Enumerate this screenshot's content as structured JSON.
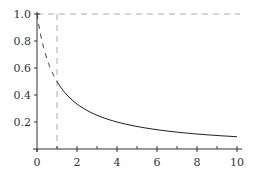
{
  "chart_data": {
    "type": "line",
    "title": "",
    "xlabel": "",
    "ylabel": "",
    "xlim": [
      0,
      10
    ],
    "ylim": [
      0,
      1.0
    ],
    "grid": false,
    "x_ticks": [
      "0",
      "2",
      "4",
      "6",
      "8",
      "10"
    ],
    "x_minor_ticks": [
      1,
      3,
      5,
      7,
      9
    ],
    "y_ticks": [
      "0.2",
      "0.4",
      "0.6",
      "0.8",
      "1.0"
    ],
    "series": [
      {
        "name": "f(x) = 1/(1+x), 0 ≤ x ≤ 1",
        "style": "dashed",
        "color": "#333333",
        "x": [
          0,
          0.25,
          0.5,
          0.75,
          1
        ],
        "y": [
          1.0,
          0.8,
          0.667,
          0.571,
          0.5
        ]
      },
      {
        "name": "f(x) = 1/(1+x), 1 ≤ x ≤ 10",
        "style": "solid",
        "color": "#222222",
        "x": [
          1,
          2,
          3,
          4,
          5,
          6,
          7,
          8,
          9,
          10
        ],
        "y": [
          0.5,
          0.333,
          0.25,
          0.2,
          0.167,
          0.143,
          0.125,
          0.111,
          0.1,
          0.091
        ]
      }
    ],
    "reference_lines": [
      {
        "orientation": "horizontal",
        "value": 1.0,
        "style": "dashed",
        "color": "#aaaaaa"
      },
      {
        "orientation": "vertical",
        "value": 1.0,
        "style": "dashed",
        "color": "#aaaaaa"
      }
    ]
  },
  "axes": {
    "x_tick_labels": [
      "0",
      "2",
      "4",
      "6",
      "8",
      "10"
    ],
    "y_tick_labels": [
      "0.2",
      "0.4",
      "0.6",
      "0.8",
      "1.0"
    ]
  }
}
